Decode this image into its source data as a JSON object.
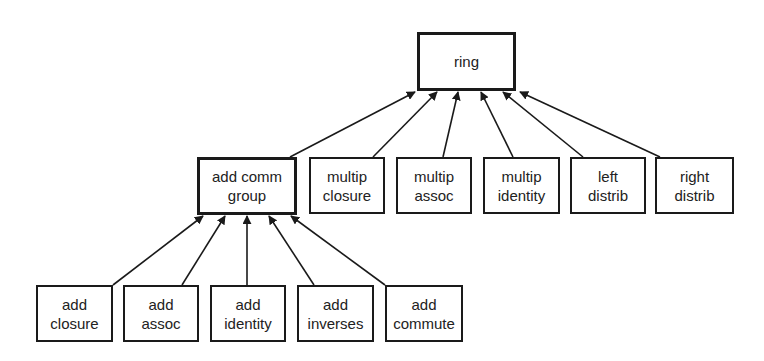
{
  "diagram": {
    "type": "hierarchy",
    "nodes": [
      {
        "id": "ring",
        "label": "ring",
        "x": 417,
        "y": 32,
        "w": 99,
        "h": 59,
        "thick": true
      },
      {
        "id": "add_comm_group",
        "label": "add comm\ngroup",
        "x": 197,
        "y": 157,
        "w": 100,
        "h": 58,
        "thick": true
      },
      {
        "id": "multip_closure",
        "label": "multip\nclosure",
        "x": 309,
        "y": 157,
        "w": 76,
        "h": 57,
        "thick": false
      },
      {
        "id": "multip_assoc",
        "label": "multip\nassoc",
        "x": 396,
        "y": 157,
        "w": 76,
        "h": 57,
        "thick": false
      },
      {
        "id": "multip_identity",
        "label": "multip\nidentity",
        "x": 483,
        "y": 157,
        "w": 77,
        "h": 57,
        "thick": false
      },
      {
        "id": "left_distrib",
        "label": "left\ndistrib",
        "x": 570,
        "y": 157,
        "w": 76,
        "h": 57,
        "thick": false
      },
      {
        "id": "right_distrib",
        "label": "right\ndistrib",
        "x": 655,
        "y": 157,
        "w": 79,
        "h": 57,
        "thick": false
      },
      {
        "id": "add_closure",
        "label": "add\nclosure",
        "x": 36,
        "y": 285,
        "w": 77,
        "h": 57,
        "thick": false
      },
      {
        "id": "add_assoc",
        "label": "add\nassoc",
        "x": 123,
        "y": 285,
        "w": 76,
        "h": 57,
        "thick": false
      },
      {
        "id": "add_identity",
        "label": "add\nidentity",
        "x": 210,
        "y": 285,
        "w": 76,
        "h": 57,
        "thick": false
      },
      {
        "id": "add_inverses",
        "label": "add\ninverses",
        "x": 297,
        "y": 285,
        "w": 77,
        "h": 57,
        "thick": false
      },
      {
        "id": "add_commute",
        "label": "add\ncommute",
        "x": 385,
        "y": 285,
        "w": 78,
        "h": 57,
        "thick": false
      }
    ],
    "edges": [
      {
        "from": "add_comm_group",
        "to": "ring",
        "x1": 290,
        "y1": 157,
        "x2": 415,
        "y2": 92
      },
      {
        "from": "multip_closure",
        "to": "ring",
        "x1": 373,
        "y1": 157,
        "x2": 437,
        "y2": 92
      },
      {
        "from": "multip_assoc",
        "to": "ring",
        "x1": 443,
        "y1": 157,
        "x2": 458,
        "y2": 92
      },
      {
        "from": "multip_identity",
        "to": "ring",
        "x1": 513,
        "y1": 157,
        "x2": 481,
        "y2": 92
      },
      {
        "from": "left_distrib",
        "to": "ring",
        "x1": 583,
        "y1": 157,
        "x2": 503,
        "y2": 92
      },
      {
        "from": "right_distrib",
        "to": "ring",
        "x1": 660,
        "y1": 157,
        "x2": 520,
        "y2": 92
      },
      {
        "from": "add_closure",
        "to": "add_comm_group",
        "x1": 113,
        "y1": 285,
        "x2": 203,
        "y2": 216
      },
      {
        "from": "add_assoc",
        "to": "add_comm_group",
        "x1": 182,
        "y1": 285,
        "x2": 225,
        "y2": 216
      },
      {
        "from": "add_identity",
        "to": "add_comm_group",
        "x1": 247,
        "y1": 285,
        "x2": 247,
        "y2": 216
      },
      {
        "from": "add_inverses",
        "to": "add_comm_group",
        "x1": 314,
        "y1": 285,
        "x2": 269,
        "y2": 216
      },
      {
        "from": "add_commute",
        "to": "add_comm_group",
        "x1": 385,
        "y1": 285,
        "x2": 291,
        "y2": 216
      }
    ]
  }
}
